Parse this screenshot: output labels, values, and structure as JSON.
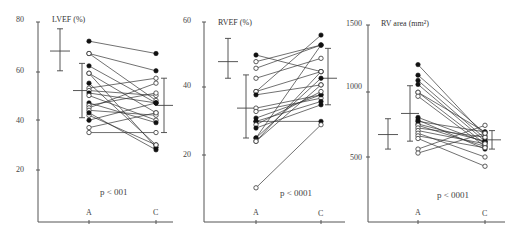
{
  "chart_data": [
    {
      "type": "line",
      "title": "LVEF (%)",
      "xlabel": "",
      "ylabel": "LVEF (%)",
      "categories": [
        "A",
        "C"
      ],
      "y_ticks": [
        20,
        40,
        60,
        80
      ],
      "ylim": [
        0,
        80
      ],
      "grid": false,
      "annotation": "p < 001",
      "normal_reference": {
        "mean": 68,
        "sd_low": 60,
        "sd_high": 77
      },
      "group_A": {
        "mean": 52,
        "sd_low": 41,
        "sd_high": 63
      },
      "group_C": {
        "mean": 46,
        "sd_low": 35,
        "sd_high": 57
      },
      "series": [
        {
          "A": 72,
          "C": 67,
          "filled": true
        },
        {
          "A": 67,
          "C": 60,
          "filled": true
        },
        {
          "A": 67,
          "C": 48,
          "filled": false
        },
        {
          "A": 62,
          "C": 47,
          "filled": true
        },
        {
          "A": 59,
          "C": 29,
          "filled": true
        },
        {
          "A": 59,
          "C": 43,
          "filled": false
        },
        {
          "A": 55,
          "C": 30,
          "filled": true
        },
        {
          "A": 53,
          "C": 57,
          "filled": false
        },
        {
          "A": 52,
          "C": 50,
          "filled": false
        },
        {
          "A": 51,
          "C": 47,
          "filled": true
        },
        {
          "A": 50,
          "C": 40,
          "filled": false
        },
        {
          "A": 47,
          "C": 39,
          "filled": true
        },
        {
          "A": 46,
          "C": 51,
          "filled": false
        },
        {
          "A": 45,
          "C": 55,
          "filled": false
        },
        {
          "A": 44,
          "C": 42,
          "filled": false
        },
        {
          "A": 42,
          "C": 30,
          "filled": false
        },
        {
          "A": 40,
          "C": 47,
          "filled": true
        },
        {
          "A": 37,
          "C": 43,
          "filled": false
        },
        {
          "A": 35,
          "C": 35,
          "filled": false
        },
        {
          "A": 43,
          "C": 28,
          "filled": true
        }
      ]
    },
    {
      "type": "line",
      "title": "RVEF (%)",
      "xlabel": "",
      "ylabel": "RVEF (%)",
      "categories": [
        "A",
        "C"
      ],
      "y_ticks": [
        20,
        40,
        60
      ],
      "ylim": [
        0,
        60
      ],
      "grid": false,
      "annotation": "p < 0001",
      "normal_reference": {
        "mean": 48,
        "sd_low": 43,
        "sd_high": 55
      },
      "group_A": {
        "mean": 34,
        "sd_low": 25,
        "sd_high": 44
      },
      "group_C": {
        "mean": 43,
        "sd_low": 35,
        "sd_high": 52
      },
      "series": [
        {
          "A": 50,
          "C": 45,
          "filled": true
        },
        {
          "A": 48,
          "C": 53,
          "filled": false
        },
        {
          "A": 46,
          "C": 53,
          "filled": false
        },
        {
          "A": 43,
          "C": 49,
          "filled": false
        },
        {
          "A": 39,
          "C": 56,
          "filled": true
        },
        {
          "A": 39,
          "C": 45,
          "filled": false
        },
        {
          "A": 38,
          "C": 41,
          "filled": true
        },
        {
          "A": 34,
          "C": 38,
          "filled": false
        },
        {
          "A": 33,
          "C": 37,
          "filled": false
        },
        {
          "A": 31,
          "C": 38,
          "filled": true
        },
        {
          "A": 30,
          "C": 36,
          "filled": true
        },
        {
          "A": 30,
          "C": 30,
          "filled": true
        },
        {
          "A": 29,
          "C": 39,
          "filled": false
        },
        {
          "A": 28,
          "C": 35,
          "filled": true
        },
        {
          "A": 25,
          "C": 53,
          "filled": true
        },
        {
          "A": 25,
          "C": 43,
          "filled": true
        },
        {
          "A": 24,
          "C": 45,
          "filled": false
        },
        {
          "A": 24,
          "C": 41,
          "filled": false
        },
        {
          "A": 10,
          "C": 29,
          "filled": false
        }
      ]
    },
    {
      "type": "line",
      "title": "RV area (mm²)",
      "xlabel": "",
      "ylabel": "RV area (mm²)",
      "categories": [
        "A",
        "C"
      ],
      "y_ticks": [
        500,
        1000,
        1500
      ],
      "ylim": [
        0,
        1500
      ],
      "grid": false,
      "annotation": "p < 0001",
      "normal_reference": {
        "mean": 670,
        "sd_low": 560,
        "sd_high": 790
      },
      "group_A": {
        "mean": 830,
        "sd_low": 620,
        "sd_high": 1040
      },
      "group_C": {
        "mean": 630,
        "sd_low": 560,
        "sd_high": 700
      },
      "series": [
        {
          "A": 1200,
          "C": 660,
          "filled": true
        },
        {
          "A": 1120,
          "C": 680,
          "filled": true
        },
        {
          "A": 1080,
          "C": 640,
          "filled": true
        },
        {
          "A": 1050,
          "C": 620,
          "filled": true
        },
        {
          "A": 990,
          "C": 690,
          "filled": false
        },
        {
          "A": 990,
          "C": 600,
          "filled": false
        },
        {
          "A": 960,
          "C": 580,
          "filled": false
        },
        {
          "A": 800,
          "C": 610,
          "filled": true
        },
        {
          "A": 780,
          "C": 560,
          "filled": true
        },
        {
          "A": 770,
          "C": 690,
          "filled": true
        },
        {
          "A": 750,
          "C": 620,
          "filled": true
        },
        {
          "A": 740,
          "C": 580,
          "filled": false
        },
        {
          "A": 720,
          "C": 650,
          "filled": false
        },
        {
          "A": 700,
          "C": 600,
          "filled": false
        },
        {
          "A": 680,
          "C": 500,
          "filled": false
        },
        {
          "A": 660,
          "C": 570,
          "filled": false
        },
        {
          "A": 640,
          "C": 430,
          "filled": false
        },
        {
          "A": 560,
          "C": 740,
          "filled": false
        },
        {
          "A": 530,
          "C": 680,
          "filled": false
        }
      ]
    }
  ],
  "panels": [
    {
      "title": "LVEF (%)",
      "tick_labels": [
        "80",
        "60",
        "40",
        "20"
      ],
      "pval": "p < 001",
      "cat_a": "A",
      "cat_c": "C"
    },
    {
      "title": "RVEF (%)",
      "tick_labels": [
        "60",
        "40",
        "20"
      ],
      "pval": "p < 0001",
      "cat_a": "A",
      "cat_c": "C"
    },
    {
      "title": "RV area (mm²)",
      "tick_labels": [
        "1500",
        "1000",
        "500"
      ],
      "pval": "p < 0001",
      "cat_a": "A",
      "cat_c": "C"
    }
  ]
}
